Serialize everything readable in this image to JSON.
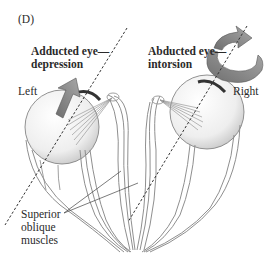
{
  "panel_label": "(D)",
  "labels": {
    "adducted_line1": "Adducted eye—",
    "adducted_line2": "depression",
    "abducted_line1": "Abducted eye—",
    "abducted_line2": "intorsion",
    "left": "Left",
    "right": "Right",
    "muscle_line1": "Superior",
    "muscle_line2": "oblique",
    "muscle_line3": "muscles"
  },
  "icons": {
    "left_arrow": "straight-arrow-up-right",
    "right_arrow": "curved-rotation-arrow"
  },
  "colors": {
    "arrow_fill": "#8a8a8a",
    "muscle_stroke": "#9a9a9a",
    "dashed_axis": "#333333",
    "eyeball": "#f2f2f2"
  }
}
